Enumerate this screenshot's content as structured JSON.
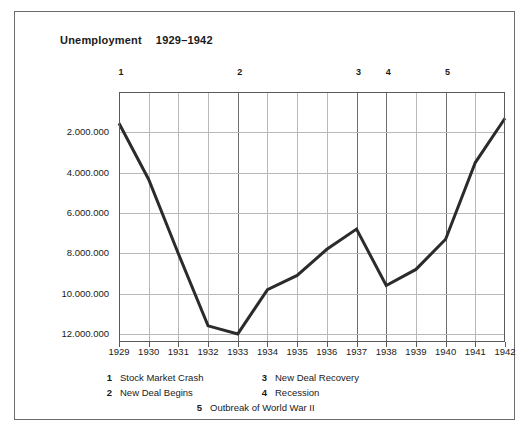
{
  "title": {
    "label": "Unemployment",
    "range": "1929–1942"
  },
  "chart_data": {
    "type": "line",
    "xlabel": "",
    "ylabel": "",
    "x": [
      1929,
      1930,
      1931,
      1932,
      1933,
      1934,
      1935,
      1936,
      1937,
      1938,
      1939,
      1940,
      1941,
      1942
    ],
    "categories": [
      "1929",
      "1930",
      "1931",
      "1932",
      "1933",
      "1934",
      "1935",
      "1936",
      "1937",
      "1938",
      "1939",
      "1940",
      "1941",
      "1942"
    ],
    "values": [
      1550000,
      4340000,
      8020000,
      11600000,
      12000000,
      9800000,
      9100000,
      7800000,
      6800000,
      9600000,
      8800000,
      7300000,
      3500000,
      1300000
    ],
    "ylim": [
      0,
      12400000
    ],
    "y_inverted": true,
    "ytick_values": [
      2000000,
      4000000,
      6000000,
      8000000,
      10000000,
      12000000
    ],
    "ytick_labels": [
      "2.000.000",
      "4.000.000",
      "6.000.000",
      "8.000.000",
      "10.000.000",
      "12.000.000"
    ],
    "grid": true,
    "legend_position": "below",
    "line_color": "#2b2b2b",
    "grid_color": "#b9b9b9",
    "axis_color": "#5a5a5a",
    "annotations": [
      {
        "id": "1",
        "x": 1929,
        "label": "Stock Market Crash"
      },
      {
        "id": "2",
        "x": 1933,
        "label": "New Deal Begins"
      },
      {
        "id": "3",
        "x": 1937,
        "label": "New Deal Recovery"
      },
      {
        "id": "4",
        "x": 1938,
        "label": "Recession"
      },
      {
        "id": "5",
        "x": 1940,
        "label": "Outbreak of World War II"
      }
    ]
  },
  "markers": [
    {
      "id": "1",
      "x": 1929
    },
    {
      "id": "2",
      "x": 1933
    },
    {
      "id": "3",
      "x": 1937
    },
    {
      "id": "4",
      "x": 1938
    },
    {
      "id": "5",
      "x": 1940
    }
  ],
  "legend": {
    "row1": {
      "n1": "1",
      "t1": "Stock Market Crash",
      "n2": "3",
      "t2": "New Deal Recovery"
    },
    "row2": {
      "n1": "2",
      "t1": "New Deal Begins",
      "n2": "4",
      "t2": "Recession"
    },
    "row3": {
      "n": "5",
      "t": "Outbreak of World War II"
    }
  }
}
